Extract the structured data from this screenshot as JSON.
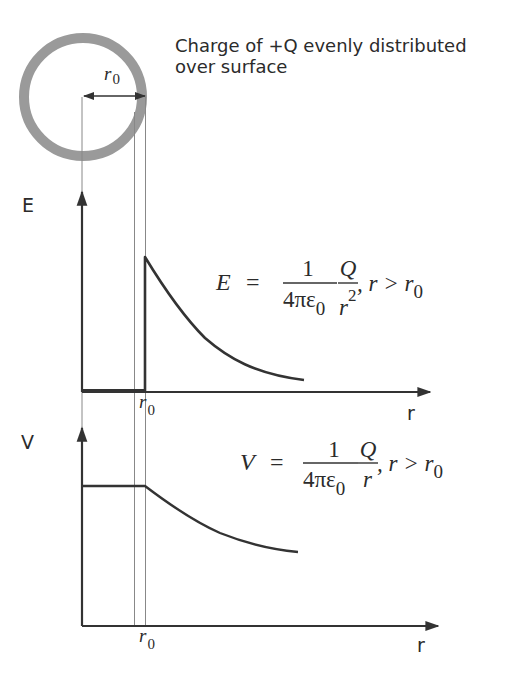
{
  "shell": {
    "description": "Charge of +Q evenly distributed",
    "description_line2": "over surface",
    "ring_color": "#9a9a9a",
    "radius_label": "r",
    "radius_sub": "0"
  },
  "e_graph": {
    "y_label": "E",
    "x_label": "r",
    "r0_label": "r",
    "r0_sub": "0",
    "formula": {
      "lhs": "E",
      "eq": "=",
      "num1": "1",
      "den1": "4πε",
      "den1_sub": "0",
      "num2": "Q",
      "den2": "r",
      "den2_sup": "2",
      "cond": ", r > r",
      "cond_sub": "0"
    }
  },
  "v_graph": {
    "y_label": "V",
    "x_label": "r",
    "r0_label": "r",
    "r0_sub": "0",
    "formula": {
      "lhs": "V",
      "eq": "=",
      "num1": "1",
      "den1": "4πε",
      "den1_sub": "0",
      "num2": "Q",
      "den2": "r",
      "cond": ", r > r",
      "cond_sub": "0"
    }
  },
  "colors": {
    "line": "#333333",
    "guide": "#888888",
    "ring": "#9a9a9a"
  }
}
